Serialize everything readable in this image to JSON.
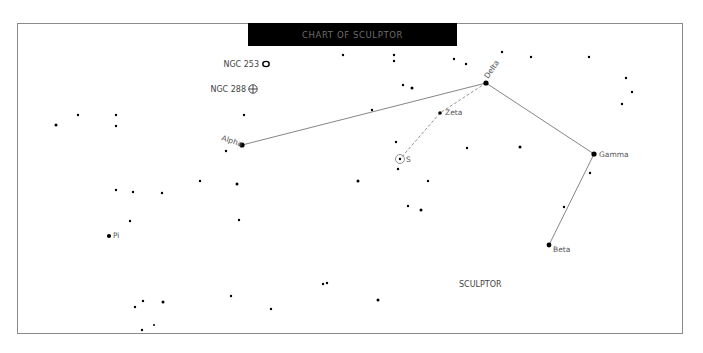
{
  "title": "CHART OF SCULPTOR",
  "constellation_label": "SCULPTOR",
  "named_stars": [
    {
      "name": "Alpha",
      "x": 242,
      "y": 145,
      "r": 2.6
    },
    {
      "name": "Delta",
      "x": 486,
      "y": 83,
      "r": 2.6
    },
    {
      "name": "Zeta",
      "x": 440,
      "y": 113,
      "r": 1.8
    },
    {
      "name": "Gamma",
      "x": 594,
      "y": 154,
      "r": 2.6
    },
    {
      "name": "Beta",
      "x": 549,
      "y": 245,
      "r": 2.4
    },
    {
      "name": "Pi",
      "x": 109,
      "y": 236,
      "r": 2.1
    },
    {
      "name": "S",
      "x": 400,
      "y": 159,
      "r": 1.2
    }
  ],
  "deep_sky": [
    {
      "name": "NGC 253",
      "x": 266,
      "y": 64,
      "symbol": "galaxy-ellipse"
    },
    {
      "name": "NGC 288",
      "x": 253,
      "y": 89,
      "symbol": "globular-cluster"
    }
  ],
  "lines_solid": [
    [
      242,
      145,
      486,
      83
    ],
    [
      486,
      83,
      594,
      154
    ],
    [
      594,
      154,
      549,
      245
    ]
  ],
  "lines_dashed": [
    [
      486,
      83,
      440,
      113
    ],
    [
      440,
      113,
      400,
      159
    ]
  ],
  "stars": [
    [
      343,
      55,
      1.2
    ],
    [
      394,
      55,
      1.2
    ],
    [
      394,
      61,
      1.2
    ],
    [
      454,
      59,
      1.2
    ],
    [
      466,
      64,
      1.2
    ],
    [
      502,
      52,
      1.2
    ],
    [
      531,
      57,
      1.2
    ],
    [
      589,
      57,
      1.2
    ],
    [
      626,
      78,
      1.2
    ],
    [
      632,
      92,
      1.2
    ],
    [
      622,
      104,
      1.2
    ],
    [
      403,
      85,
      1.2
    ],
    [
      412,
      88,
      1.5
    ],
    [
      372,
      110,
      1.2
    ],
    [
      78,
      115,
      1.2
    ],
    [
      116,
      115,
      1.2
    ],
    [
      56,
      125,
      1.5
    ],
    [
      116,
      126,
      1.2
    ],
    [
      244,
      115,
      1.2
    ],
    [
      226,
      151,
      1.2
    ],
    [
      396,
      142,
      1.2
    ],
    [
      398,
      169,
      1.2
    ],
    [
      467,
      148,
      1.2
    ],
    [
      520,
      147,
      1.5
    ],
    [
      116,
      190,
      1.2
    ],
    [
      133,
      192,
      1.2
    ],
    [
      162,
      193,
      1.2
    ],
    [
      200,
      181,
      1.2
    ],
    [
      237,
      184,
      1.5
    ],
    [
      358,
      181,
      1.5
    ],
    [
      428,
      181,
      1.2
    ],
    [
      408,
      206,
      1.2
    ],
    [
      421,
      210,
      1.5
    ],
    [
      130,
      221,
      1.2
    ],
    [
      239,
      220,
      1.2
    ],
    [
      590,
      173,
      1.2
    ],
    [
      564,
      207,
      1.2
    ],
    [
      135,
      307,
      1.2
    ],
    [
      143,
      301,
      1.2
    ],
    [
      163,
      302,
      1.5
    ],
    [
      231,
      296,
      1.2
    ],
    [
      271,
      309,
      1.2
    ],
    [
      323,
      284,
      1.2
    ],
    [
      327,
      283,
      1.2
    ],
    [
      378,
      300,
      1.5
    ],
    [
      154,
      325,
      1.0
    ],
    [
      142,
      330,
      1.2
    ]
  ]
}
